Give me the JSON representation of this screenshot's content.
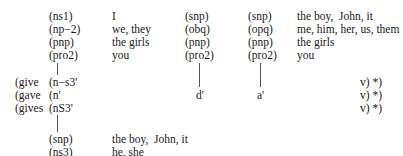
{
  "block1": {
    "left": [
      {
        "code": "(ns1)",
        "words": "I"
      },
      {
        "code": "(np−2)",
        "words": "we, they"
      },
      {
        "code": "(pnp)",
        "words": "the girls"
      },
      {
        "code": "(pro2)",
        "words": "you"
      }
    ],
    "mid": [
      "(snp)",
      "(obq)",
      "(pnp)",
      "(pro2)"
    ],
    "right": [
      {
        "code": "(snp)",
        "words": "the boy,  John, it"
      },
      {
        "code": "(opq)",
        "words": "me, him, her, us, them"
      },
      {
        "code": "(pnp)",
        "words": "the girls"
      },
      {
        "code": "(pro2)",
        "words": "you"
      }
    ]
  },
  "verbs": [
    {
      "verb": "(give",
      "code": "(n−s3'",
      "tail": "v) *)"
    },
    {
      "verb": "(gave",
      "code": "(n'",
      "tail": "v) *)"
    },
    {
      "verb": "(gives",
      "code": "(nS3'",
      "tail": "v) *)"
    }
  ],
  "labels": {
    "d": "d'",
    "a": "a'"
  },
  "block2": [
    {
      "code": "(snp)",
      "words": "the boy,  John, it"
    },
    {
      "code": "(ns3)",
      "words": "he, she"
    }
  ]
}
